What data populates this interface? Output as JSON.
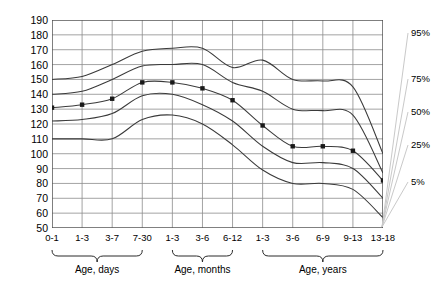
{
  "chart_data": {
    "type": "line",
    "title": "",
    "xlabel": "",
    "ylabel": "Heart Rate per Minute",
    "ylim": [
      50,
      190
    ],
    "ytick_step": 10,
    "yticks": [
      190,
      180,
      170,
      160,
      150,
      140,
      130,
      120,
      110,
      100,
      90,
      80,
      70,
      60,
      50
    ],
    "grid": true,
    "legend_position": "right",
    "categories": [
      "0-1",
      "1-3",
      "3-7",
      "7-30",
      "1-3",
      "3-6",
      "6-12",
      "1-3",
      "3-6",
      "6-9",
      "9-13",
      "13-18"
    ],
    "groups": [
      {
        "label": "Age, days",
        "categories": [
          "0-1",
          "1-3",
          "3-7",
          "7-30"
        ]
      },
      {
        "label": "Age, months",
        "categories": [
          "1-3",
          "3-6",
          "6-12"
        ]
      },
      {
        "label": "Age, years",
        "categories": [
          "1-3",
          "3-6",
          "6-9",
          "9-13",
          "13-18"
        ]
      }
    ],
    "series": [
      {
        "name": "95%",
        "label": "95%",
        "values": [
          150,
          152,
          160,
          169,
          171,
          171,
          158,
          163,
          150,
          149,
          145,
          100
        ]
      },
      {
        "name": "75%",
        "label": "75%",
        "values": [
          140,
          142,
          150,
          159,
          160,
          160,
          148,
          142,
          130,
          129,
          126,
          87
        ]
      },
      {
        "name": "50%",
        "label": "50%",
        "markers": true,
        "values": [
          131,
          133,
          137,
          148,
          148,
          144,
          136,
          119,
          105,
          105,
          102,
          82
        ]
      },
      {
        "name": "25%",
        "label": "25%",
        "values": [
          122,
          123,
          127,
          139,
          140,
          133,
          122,
          105,
          94,
          94,
          90,
          70
        ]
      },
      {
        "name": "5%",
        "label": "5%",
        "values": [
          110,
          110,
          110,
          123,
          126,
          120,
          106,
          89,
          80,
          80,
          76,
          57
        ]
      }
    ],
    "marker_points": [
      {
        "category": "0-1",
        "value": 131
      },
      {
        "category": "1-3",
        "value": 133
      },
      {
        "category": "3-7",
        "value": 137
      },
      {
        "category": "7-30",
        "value": 148
      },
      {
        "category": "1-3",
        "value": 148
      },
      {
        "category": "3-6",
        "value": 144
      },
      {
        "category": "6-12",
        "value": 136
      },
      {
        "category": "1-3",
        "value": 119
      },
      {
        "category": "3-6",
        "value": 105
      },
      {
        "category": "6-9",
        "value": 105
      },
      {
        "category": "9-13",
        "value": 102
      },
      {
        "category": "13-18",
        "value": 82
      }
    ],
    "colors": {
      "line": "#3a3a3a",
      "grid": "#8c8c8c",
      "axis": "#4a4a4a",
      "marker": "#1a1a1a",
      "leader": "#c9c9c9",
      "text": "#000000"
    }
  }
}
